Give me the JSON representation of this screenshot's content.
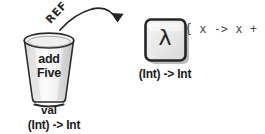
{
  "diagram": {
    "cup": {
      "label_lines": [
        "add",
        "Five"
      ],
      "label_text": "addFive",
      "keyword": "val",
      "type_signature": "(Int) -> Int"
    },
    "arrow": {
      "label": "REF",
      "direction": "cup-to-lambda"
    },
    "lambda_box": {
      "glyph": "λ",
      "type_signature": "(Int) -> Int"
    },
    "expression": "{ x -> x + 5 }",
    "colors": {
      "ink": "#1c1c1c",
      "expression_text": "#4a4a4a",
      "cup_fill": "#f2f2f2",
      "cup_shade": "#cfcfcf",
      "box_fill": "#e9e9e9",
      "box_border": "#2a2a2a",
      "shadow": "#b5b5b5",
      "background": "#ffffff"
    }
  }
}
